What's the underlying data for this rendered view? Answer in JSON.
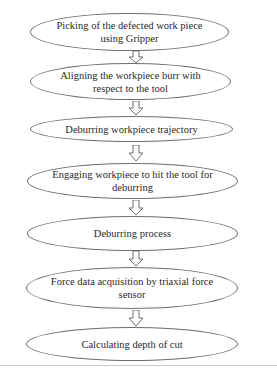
{
  "diagram": {
    "type": "flowchart",
    "direction": "top-to-bottom",
    "steps": [
      {
        "label": "Picking of the defected work piece using Gripper"
      },
      {
        "label": "Aligning the workpiece burr with respect to the tool"
      },
      {
        "label": "Deburring workpiece trajectory"
      },
      {
        "label": "Engaging workpiece to hit the tool for deburring"
      },
      {
        "label": "Deburring process"
      },
      {
        "label": "Force data acquisition by triaxial force sensor"
      },
      {
        "label": "Calculating depth of cut"
      }
    ],
    "connector": "hollow-down-arrow-icon",
    "colors": {
      "stroke": "#6e6e6e",
      "text": "#2a2a2a",
      "background": "#ffffff"
    }
  }
}
